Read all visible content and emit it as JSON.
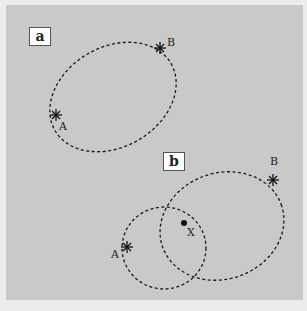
{
  "panels": [
    {
      "label": "a",
      "points": [
        {
          "name": "A"
        },
        {
          "name": "B"
        }
      ]
    },
    {
      "label": "b",
      "points": [
        {
          "name": "A"
        },
        {
          "name": "B"
        },
        {
          "name": "X"
        }
      ]
    }
  ],
  "colors": {
    "background": "#c9c9c9",
    "border": "#ececec",
    "line": "#1a1a1a"
  }
}
